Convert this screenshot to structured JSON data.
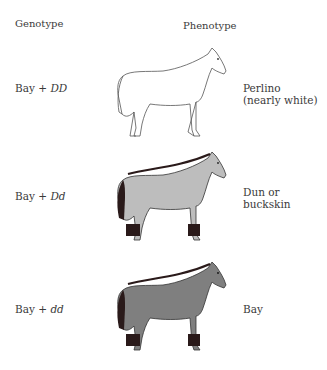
{
  "headers": {
    "genotype": "Genotype",
    "phenotype": "Phenotype"
  },
  "rows": [
    {
      "genotype_base": "Bay + ",
      "genotype_alleles": "DD",
      "phenotype_line1": "Perlino",
      "phenotype_line2": "(nearly white)",
      "body_color": "#ffffff",
      "points_color": "#ffffff",
      "outline_color": "#555555"
    },
    {
      "genotype_base": "Bay + ",
      "genotype_alleles": "Dd",
      "phenotype_line1": "Dun or",
      "phenotype_line2": "buckskin",
      "body_color": "#bdbdbd",
      "points_color": "#2a1a1a",
      "outline_color": "#333333"
    },
    {
      "genotype_base": "Bay + ",
      "genotype_alleles": "dd",
      "phenotype_line1": "Bay",
      "phenotype_line2": "",
      "body_color": "#7f7f7f",
      "points_color": "#2a1a1a",
      "outline_color": "#333333"
    }
  ]
}
